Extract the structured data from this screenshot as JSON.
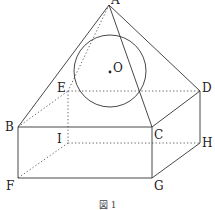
{
  "figure": {
    "caption": "図 1"
  },
  "points": {
    "A": {
      "label": "A",
      "x": 109,
      "y": 5
    },
    "B": {
      "label": "B",
      "x": 18,
      "y": 127
    },
    "C": {
      "label": "C",
      "x": 152,
      "y": 127
    },
    "D": {
      "label": "D",
      "x": 200,
      "y": 91
    },
    "E": {
      "label": "E",
      "x": 68,
      "y": 91
    },
    "F": {
      "label": "F",
      "x": 18,
      "y": 178
    },
    "G": {
      "label": "G",
      "x": 152,
      "y": 178
    },
    "H": {
      "label": "H",
      "x": 200,
      "y": 143
    },
    "I": {
      "label": "I",
      "x": 68,
      "y": 143
    },
    "O": {
      "label": "O",
      "x": 110,
      "y": 71
    }
  },
  "sphere": {
    "center": "O",
    "radius": 36
  },
  "edges": {
    "visible": [
      "A-B",
      "A-C",
      "A-D",
      "B-C",
      "C-D",
      "B-F",
      "C-G",
      "D-H",
      "F-G",
      "G-H"
    ],
    "hidden": [
      "A-E",
      "B-E",
      "E-D",
      "E-I",
      "I-F",
      "I-H"
    ]
  },
  "colors": {
    "line": "#333333",
    "background": "#ffffff"
  }
}
